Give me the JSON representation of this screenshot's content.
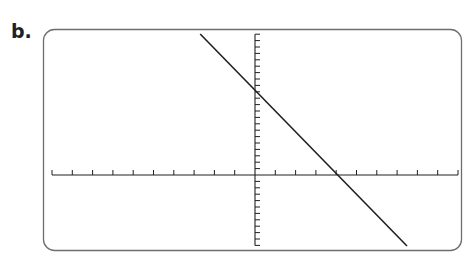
{
  "label": "b.",
  "chart_data": {
    "type": "line",
    "title": "",
    "xlabel": "",
    "ylabel": "",
    "xlim": [
      -10,
      10
    ],
    "ylim": [
      -11,
      22
    ],
    "x_tick_interval": 1,
    "y_tick_interval": 1,
    "grid": false,
    "legend": null,
    "series": [
      {
        "name": "line",
        "x": [
          -2.7,
          7.6
        ],
        "y": [
          22,
          -11
        ],
        "slope": -3.2,
        "x_intercept": 4,
        "y_intercept": 13
      }
    ]
  },
  "colors": {
    "frame": "#6d6e71",
    "axis": "#231f20",
    "line": "#231f20"
  }
}
